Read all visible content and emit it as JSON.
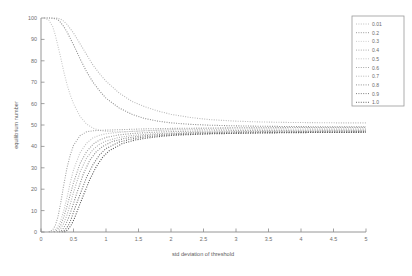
{
  "chart_data": {
    "type": "line",
    "title": "",
    "xlabel": "std deviation of threshold",
    "ylabel": "equilibrium number",
    "xlim": [
      0,
      5
    ],
    "ylim": [
      0,
      100
    ],
    "xticks": [
      "0",
      "0.5",
      "1",
      "1.5",
      "2",
      "2.5",
      "3",
      "3.5",
      "4",
      "4.5",
      "5"
    ],
    "xtick_values": [
      0,
      0.5,
      1,
      1.5,
      2,
      2.5,
      3,
      3.5,
      4,
      4.5,
      5
    ],
    "yticks": [
      "0",
      "10",
      "20",
      "30",
      "40",
      "50",
      "60",
      "70",
      "80",
      "90",
      "100"
    ],
    "ytick_values": [
      0,
      10,
      20,
      30,
      40,
      50,
      60,
      70,
      80,
      90,
      100
    ],
    "grid": false,
    "legend_position": "upper right",
    "linestyle": "dotted",
    "series": [
      {
        "name": "0.01",
        "color": "#b9b9b9",
        "x": [
          0.05,
          0.15,
          0.25,
          0.3,
          0.35,
          0.4,
          0.45,
          0.5,
          0.6,
          0.7,
          0.8,
          0.9,
          1.0,
          1.2,
          1.4,
          1.6,
          1.8,
          2.0,
          2.3,
          2.6,
          3.0,
          3.4,
          3.8,
          4.2,
          4.6,
          5.0
        ],
        "y": [
          100,
          100,
          100,
          99.5,
          98.5,
          97,
          95,
          93,
          88,
          83,
          78,
          74,
          70.5,
          65,
          61,
          58.5,
          56.5,
          55,
          53.5,
          52.5,
          51.8,
          51.4,
          51.2,
          51.1,
          51.0,
          51.0
        ]
      },
      {
        "name": "0.2",
        "color": "#8f8f8f",
        "x": [
          0.05,
          0.15,
          0.25,
          0.3,
          0.35,
          0.4,
          0.45,
          0.5,
          0.6,
          0.7,
          0.8,
          0.9,
          1.0,
          1.2,
          1.4,
          1.6,
          1.8,
          2.0,
          2.3,
          2.6,
          3.0,
          3.4,
          3.8,
          4.2,
          4.6,
          5.0
        ],
        "y": [
          100,
          100,
          99.5,
          98,
          96,
          93.5,
          90.5,
          87.5,
          81,
          75,
          70,
          66,
          62.5,
          58,
          55,
          53,
          51.8,
          51,
          50.3,
          49.9,
          49.6,
          49.4,
          49.3,
          49.2,
          49.2,
          49.2
        ]
      },
      {
        "name": "0.3",
        "color": "#c9c9c9",
        "x": [
          0.05,
          0.12,
          0.18,
          0.22,
          0.26,
          0.3,
          0.35,
          0.4,
          0.45,
          0.5,
          0.6,
          0.7,
          0.8,
          0.9,
          1.0,
          1.2,
          1.4,
          1.6,
          1.8,
          2.0,
          2.3,
          2.6,
          3.0,
          3.4,
          3.8,
          4.2,
          4.6,
          5.0
        ],
        "y": [
          100,
          99,
          96,
          92,
          87,
          82,
          75,
          69,
          64,
          60,
          54,
          50.5,
          48.5,
          47.5,
          47,
          46.8,
          47,
          47.3,
          47.6,
          47.9,
          48.2,
          48.4,
          48.6,
          48.7,
          48.8,
          48.8,
          48.9,
          48.9
        ]
      },
      {
        "name": "0.4",
        "color": "#a5a5a5",
        "x": [
          0.12,
          0.18,
          0.22,
          0.26,
          0.3,
          0.35,
          0.4,
          0.45,
          0.5,
          0.6,
          0.7,
          0.8,
          0.9,
          1.0,
          1.2,
          1.4,
          1.6,
          1.8,
          2.0,
          2.3,
          2.6,
          3.0,
          3.4,
          3.8,
          4.2,
          4.6,
          5.0
        ],
        "y": [
          0,
          1,
          3,
          7,
          13,
          22,
          30,
          36,
          40.5,
          45,
          46.8,
          47.3,
          47.5,
          47.6,
          47.8,
          48,
          48.2,
          48.3,
          48.4,
          48.5,
          48.6,
          48.7,
          48.7,
          48.8,
          48.8,
          48.8,
          48.8
        ]
      },
      {
        "name": "0.5",
        "color": "#c2c2c2",
        "x": [
          0.15,
          0.2,
          0.25,
          0.3,
          0.35,
          0.4,
          0.45,
          0.5,
          0.6,
          0.7,
          0.8,
          0.9,
          1.0,
          1.2,
          1.4,
          1.6,
          1.8,
          2.0,
          2.3,
          2.6,
          3.0,
          3.4,
          3.8,
          4.2,
          4.6,
          5.0
        ],
        "y": [
          0,
          0.5,
          2,
          5,
          10,
          16,
          23,
          29,
          37,
          41.5,
          44,
          45.2,
          45.9,
          46.6,
          47,
          47.3,
          47.5,
          47.6,
          47.8,
          47.9,
          48.0,
          48.1,
          48.1,
          48.2,
          48.2,
          48.2
        ]
      },
      {
        "name": "0.6",
        "color": "#9c9c9c",
        "x": [
          0.2,
          0.25,
          0.3,
          0.35,
          0.4,
          0.45,
          0.5,
          0.6,
          0.7,
          0.8,
          0.9,
          1.0,
          1.2,
          1.4,
          1.6,
          1.8,
          2.0,
          2.3,
          2.6,
          3.0,
          3.4,
          3.8,
          4.2,
          4.6,
          5.0
        ],
        "y": [
          0,
          1,
          3,
          7,
          12,
          17.5,
          23,
          32,
          37.5,
          41,
          43,
          44.2,
          45.4,
          46,
          46.4,
          46.7,
          46.9,
          47.1,
          47.2,
          47.4,
          47.5,
          47.5,
          47.6,
          47.6,
          47.6
        ]
      },
      {
        "name": "0.7",
        "color": "#b0b0b0",
        "x": [
          0.25,
          0.3,
          0.35,
          0.4,
          0.45,
          0.5,
          0.6,
          0.7,
          0.8,
          0.9,
          1.0,
          1.2,
          1.4,
          1.6,
          1.8,
          2.0,
          2.3,
          2.6,
          3.0,
          3.4,
          3.8,
          4.2,
          4.6,
          5.0
        ],
        "y": [
          0,
          1.5,
          4,
          8,
          13,
          18.5,
          28,
          34.5,
          38.5,
          41,
          42.5,
          44.2,
          45.1,
          45.6,
          46,
          46.2,
          46.5,
          46.7,
          46.9,
          47.0,
          47.1,
          47.1,
          47.2,
          47.2
        ]
      },
      {
        "name": "0.8",
        "color": "#878787",
        "x": [
          0.28,
          0.33,
          0.38,
          0.43,
          0.48,
          0.55,
          0.65,
          0.75,
          0.85,
          0.95,
          1.1,
          1.3,
          1.5,
          1.7,
          1.9,
          2.1,
          2.4,
          2.7,
          3.1,
          3.5,
          3.9,
          4.3,
          4.7,
          5.0
        ],
        "y": [
          0,
          1,
          3.5,
          7,
          11.5,
          18,
          27,
          33.5,
          37.5,
          40,
          42.3,
          43.8,
          44.7,
          45.3,
          45.7,
          46.0,
          46.3,
          46.5,
          46.7,
          46.8,
          46.9,
          47.0,
          47.0,
          47.0
        ]
      },
      {
        "name": "0.9",
        "color": "#6f6f6f",
        "x": [
          0.32,
          0.37,
          0.42,
          0.47,
          0.52,
          0.6,
          0.7,
          0.8,
          0.9,
          1.0,
          1.2,
          1.4,
          1.6,
          1.8,
          2.0,
          2.3,
          2.6,
          3.0,
          3.4,
          3.8,
          4.2,
          4.6,
          5.0
        ],
        "y": [
          0,
          1,
          3,
          6.5,
          11,
          17.5,
          25.5,
          31.5,
          36,
          39,
          42,
          43.5,
          44.4,
          45.0,
          45.4,
          45.8,
          46.0,
          46.3,
          46.4,
          46.5,
          46.6,
          46.6,
          46.7
        ]
      },
      {
        "name": "1.0",
        "color": "#555555",
        "x": [
          0.36,
          0.41,
          0.46,
          0.51,
          0.56,
          0.65,
          0.75,
          0.85,
          0.95,
          1.05,
          1.25,
          1.45,
          1.65,
          1.85,
          2.05,
          2.35,
          2.65,
          3.05,
          3.45,
          3.85,
          4.25,
          4.65,
          5.0
        ],
        "y": [
          0,
          1,
          3,
          6,
          10,
          17,
          24.5,
          30.5,
          35,
          38,
          41.3,
          43,
          44,
          44.7,
          45.2,
          45.6,
          45.9,
          46.1,
          46.3,
          46.4,
          46.5,
          46.5,
          46.6
        ]
      }
    ]
  },
  "legend": {
    "entries": [
      "0.01",
      "0.2",
      "0.3",
      "0.4",
      "0.5",
      "0.6",
      "0.7",
      "0.8",
      "0.9",
      "1.0"
    ]
  }
}
